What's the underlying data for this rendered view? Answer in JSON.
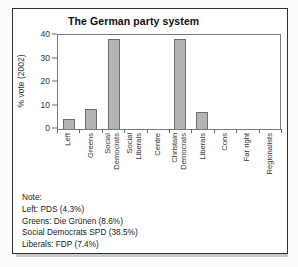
{
  "figure": {
    "title": "The German party system",
    "border_color": "#2f2f2f",
    "background": "#ffffff"
  },
  "chart_data": {
    "type": "bar",
    "title": "The German party system",
    "ylabel": "% vote (2002)",
    "xlabel": "",
    "ylim": [
      0,
      40
    ],
    "yticks": [
      0,
      10,
      20,
      30,
      40
    ],
    "grid": false,
    "legend": "none",
    "categories": [
      "Left",
      "Greens",
      "Social Democrats",
      "Social Liberals",
      "Centre",
      "Christain Democrats",
      "Liberals",
      "Cons",
      "Far right",
      "Regionalists"
    ],
    "category_label_lines": [
      [
        "Left"
      ],
      [
        "Greens"
      ],
      [
        "Social",
        "Democrats"
      ],
      [
        "Social",
        "Liberals"
      ],
      [
        "Centre"
      ],
      [
        "Christain",
        "Democrats"
      ],
      [
        "Liberals"
      ],
      [
        "Cons"
      ],
      [
        "Far right"
      ],
      [
        "Regionalists"
      ]
    ],
    "values": [
      4.3,
      8.6,
      38.5,
      0,
      0,
      38.5,
      7.4,
      0,
      0,
      0
    ],
    "bar_fill": "#b4b4b4",
    "bar_border": "#6e6e6e",
    "axis_color": "#6a6a6a"
  },
  "note": {
    "heading": "Note:",
    "lines": [
      "Left: PDS (4.3%)",
      "Greens: Die Grünen (8.6%)",
      "Social Democrats SPD (38.5%)",
      "Liberals: FDP (7.4%)"
    ]
  }
}
